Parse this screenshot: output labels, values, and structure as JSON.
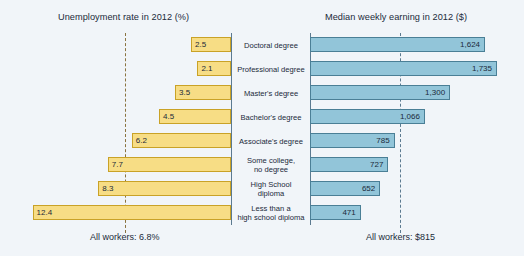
{
  "chart_data": {
    "type": "bar",
    "layout": "diverging-bidirectional",
    "categories": [
      "Doctoral degree",
      "Professional degree",
      "Master's degree",
      "Bachelor's degree",
      "Associate's degree",
      "Some college, no degree",
      "High School diploma",
      "Less than a high school diploma"
    ],
    "series": [
      {
        "name": "Unemployment rate in 2012 (%)",
        "side": "left",
        "unit": "%",
        "color": "#f7dd85",
        "values": [
          2.5,
          2.1,
          3.5,
          4.5,
          6.2,
          7.7,
          8.3,
          12.4
        ],
        "reference_value": 6.8,
        "reference_label": "All workers: 6.8%"
      },
      {
        "name": "Median weekly earning in 2012 ($)",
        "side": "right",
        "unit": "$",
        "color": "#92c5d9",
        "values": [
          1624,
          1735,
          1300,
          1066,
          785,
          727,
          652,
          471
        ],
        "value_labels": [
          "1,624",
          "1,735",
          "1,300",
          "1,066",
          "785",
          "727",
          "652",
          "471"
        ],
        "reference_value": 815,
        "reference_label": "All workers: $815"
      }
    ],
    "grid": false,
    "legend_position": "none"
  },
  "panels": {
    "left": {
      "title": "Unemployment rate in 2012 (%)",
      "footer": "All workers: 6.8%"
    },
    "right": {
      "title": "Median weekly earning in 2012 ($)",
      "footer": "All workers: $815"
    }
  },
  "rows": [
    {
      "category": "Doctoral degree",
      "left_value": "2.5",
      "right_value": "1,624"
    },
    {
      "category": "Professional degree",
      "left_value": "2.1",
      "right_value": "1,735"
    },
    {
      "category": "Master's degree",
      "left_value": "3.5",
      "right_value": "1,300"
    },
    {
      "category": "Bachelor's degree",
      "left_value": "4.5",
      "right_value": "1,066"
    },
    {
      "category": "Associate's degree",
      "left_value": "6.2",
      "right_value": "785"
    },
    {
      "category": "Some college,\nno degree",
      "left_value": "7.7",
      "right_value": "727"
    },
    {
      "category": "High School\ndiploma",
      "left_value": "8.3",
      "right_value": "652"
    },
    {
      "category": "Less than a\nhigh school diploma",
      "left_value": "12.4",
      "right_value": "471"
    }
  ],
  "colors": {
    "background": "#f1f5f9",
    "left_bar_fill": "#f7dd85",
    "left_bar_stroke": "#c9a227",
    "right_bar_fill": "#92c5d9",
    "right_bar_stroke": "#4a7f96",
    "text": "#1b2a3a"
  }
}
